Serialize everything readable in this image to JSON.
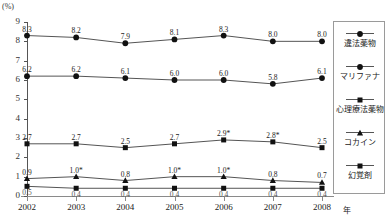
{
  "unit_label": "(%)",
  "title_partial": "",
  "x_axis_suffix": "年",
  "legend": {
    "items": [
      {
        "label": "違法薬物",
        "marker": "circle"
      },
      {
        "label": "マリファナ",
        "marker": "circle"
      },
      {
        "label": "心理療法薬物",
        "marker": "square"
      },
      {
        "label": "コカイン",
        "marker": "triangle"
      },
      {
        "label": "幻覚剤",
        "marker": "square"
      }
    ]
  },
  "chart_data": {
    "type": "line",
    "title": "",
    "xlabel": "年",
    "ylabel": "(%)",
    "ylim": [
      0,
      9
    ],
    "yticks": [
      0,
      1,
      2,
      3,
      4,
      5,
      6,
      7,
      8,
      9
    ],
    "grid": false,
    "legend_position": "right",
    "categories": [
      "2002",
      "2003",
      "2004",
      "2005",
      "2006",
      "2007",
      "2008"
    ],
    "series": [
      {
        "name": "違法薬物",
        "marker": "circle",
        "values": [
          8.3,
          8.2,
          7.9,
          8.1,
          8.3,
          8.0,
          8.0
        ],
        "labels": [
          "8.3",
          "8.2",
          "7.9",
          "8.1",
          "8.3",
          "8.0",
          "8.0"
        ]
      },
      {
        "name": "マリファナ",
        "marker": "circle",
        "values": [
          6.2,
          6.2,
          6.1,
          6.0,
          6.0,
          5.8,
          6.1
        ],
        "labels": [
          "6.2",
          "6.2",
          "6.1",
          "6.0",
          "6.0",
          "5.8",
          "6.1"
        ]
      },
      {
        "name": "心理療法薬物",
        "marker": "square",
        "values": [
          2.7,
          2.7,
          2.5,
          2.7,
          2.9,
          2.8,
          2.5
        ],
        "labels": [
          "2.7",
          "2.7",
          "2.5",
          "2.7",
          "2.9*",
          "2.8*",
          "2.5"
        ]
      },
      {
        "name": "コカイン",
        "marker": "triangle",
        "values": [
          0.9,
          1.0,
          0.8,
          1.0,
          1.0,
          0.8,
          0.7
        ],
        "labels": [
          "0.9",
          "1.0*",
          "0.8",
          "1.0*",
          "1.0*",
          "0.8",
          "0.7"
        ]
      },
      {
        "name": "幻覚剤",
        "marker": "square",
        "values": [
          0.5,
          0.4,
          0.4,
          0.4,
          0.4,
          0.4,
          0.4
        ],
        "labels": [
          "0.5",
          "0.4",
          "0.4",
          "0.4",
          "0.4",
          "0.4",
          "0.4"
        ]
      }
    ]
  }
}
